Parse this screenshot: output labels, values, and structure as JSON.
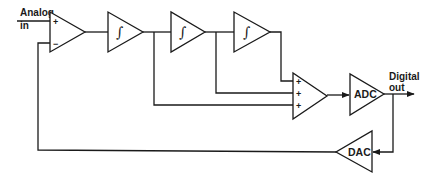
{
  "diagram": {
    "type": "block-diagram",
    "input_label": {
      "line1": "Analog",
      "line2": "in"
    },
    "output_label": {
      "line1": "Digital",
      "line2": "out"
    },
    "comparator": {
      "plus_sign": "+",
      "minus_sign": "−"
    },
    "integrators": [
      {
        "symbol": "∫"
      },
      {
        "symbol": "∫"
      },
      {
        "symbol": "∫"
      }
    ],
    "summer": {
      "signs": [
        "+",
        "+",
        "+"
      ]
    },
    "adc": {
      "label": "ADC"
    },
    "dac": {
      "label": "DAC"
    },
    "colors": {
      "stroke": "#1a1a1a",
      "background": "#ffffff"
    }
  }
}
